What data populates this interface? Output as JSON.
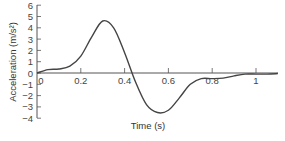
{
  "chart_data": {
    "type": "line",
    "title": "",
    "xlabel": "Time (s)",
    "ylabel": "Acceleration (m/s²)",
    "xlim": [
      0,
      1.1
    ],
    "ylim": [
      -4,
      6
    ],
    "grid": false,
    "x_ticks": [
      "0",
      "0.2",
      "0.4",
      "0.6",
      "0.8",
      "1"
    ],
    "y_ticks": [
      "6",
      "5",
      "4",
      "3",
      "2",
      "1",
      "0",
      "−1",
      "−2",
      "−3",
      "−4"
    ],
    "series": [
      {
        "name": "acceleration",
        "x": [
          0,
          0.05,
          0.1,
          0.15,
          0.2,
          0.25,
          0.3,
          0.35,
          0.4,
          0.45,
          0.5,
          0.55,
          0.6,
          0.65,
          0.7,
          0.75,
          0.8,
          0.85,
          0.9,
          0.95,
          1.0,
          1.05,
          1.1
        ],
        "values": [
          0,
          0.3,
          0.35,
          0.6,
          1.5,
          3.2,
          4.6,
          4.0,
          1.8,
          -0.8,
          -2.8,
          -3.5,
          -3.3,
          -2.2,
          -1.0,
          -0.5,
          -0.5,
          -0.45,
          -0.25,
          -0.1,
          -0.1,
          -0.1,
          -0.05
        ]
      }
    ]
  }
}
